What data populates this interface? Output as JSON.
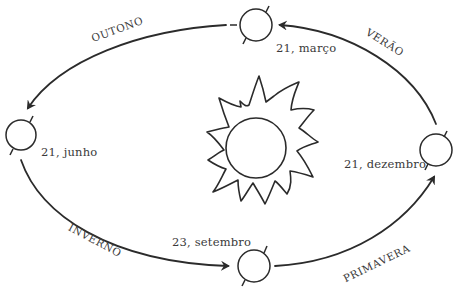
{
  "diagram": {
    "title": "",
    "center": {
      "name": "sol",
      "icon": "sun-icon"
    },
    "positions": [
      {
        "id": "marco",
        "date_label": "21, março"
      },
      {
        "id": "junho",
        "date_label": "21, junho"
      },
      {
        "id": "setembro",
        "date_label": "23, setembro"
      },
      {
        "id": "dezembro",
        "date_label": "21, dezembro"
      }
    ],
    "seasons": [
      {
        "id": "outono",
        "label": "OUTONO",
        "from": "21, março",
        "to": "21, junho"
      },
      {
        "id": "inverno",
        "label": "INVERNO",
        "from": "21, junho",
        "to": "23, setembro"
      },
      {
        "id": "primavera",
        "label": "PRIMAVERA",
        "from": "23, setembro",
        "to": "21, dezembro"
      },
      {
        "id": "verao",
        "label": "VERÃO",
        "from": "21, dezembro",
        "to": "21, março"
      }
    ],
    "colors": {
      "stroke": "#2b2b2b",
      "text": "#3a3a3a",
      "background": "#ffffff"
    }
  }
}
